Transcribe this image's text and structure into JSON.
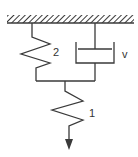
{
  "diagram": {
    "type": "spring-dashpot mechanical model",
    "colors": {
      "line": "#3a3a3a",
      "background": "#ffffff"
    },
    "wall": {
      "label": "fixed support (hatched)"
    },
    "labels": {
      "spring_upper": "2",
      "dashpot": "v",
      "spring_lower": "1"
    },
    "elements": [
      {
        "id": "spring-2",
        "kind": "spring",
        "label": "2",
        "connection": "parallel with dashpot"
      },
      {
        "id": "dashpot-v",
        "kind": "dashpot",
        "label": "v",
        "connection": "parallel with spring 2"
      },
      {
        "id": "spring-1",
        "kind": "spring",
        "label": "1",
        "connection": "series with parallel block"
      }
    ],
    "load": {
      "direction": "down",
      "icon": "arrow-down"
    }
  }
}
